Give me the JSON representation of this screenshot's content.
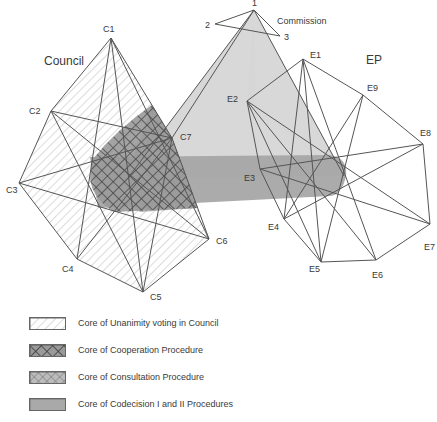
{
  "diagram": {
    "groups": {
      "council": "Council",
      "commission": "Commission",
      "ep": "EP"
    },
    "council_vertices": [
      {
        "id": "C1",
        "x": 111,
        "y": 38
      },
      {
        "id": "C2",
        "x": 51,
        "y": 111
      },
      {
        "id": "C3",
        "x": 19,
        "y": 183
      },
      {
        "id": "C4",
        "x": 77,
        "y": 259
      },
      {
        "id": "C5",
        "x": 143,
        "y": 292
      },
      {
        "id": "C6",
        "x": 209,
        "y": 239
      },
      {
        "id": "C7",
        "x": 172,
        "y": 138
      }
    ],
    "commission_vertices": [
      {
        "id": "1",
        "x": 254,
        "y": 10
      },
      {
        "id": "2",
        "x": 215,
        "y": 24
      },
      {
        "id": "3",
        "x": 280,
        "y": 36
      }
    ],
    "ep_vertices": [
      {
        "id": "E1",
        "x": 303,
        "y": 59
      },
      {
        "id": "E2",
        "x": 247,
        "y": 101
      },
      {
        "id": "E3",
        "x": 260,
        "y": 169
      },
      {
        "id": "E4",
        "x": 284,
        "y": 219
      },
      {
        "id": "E5",
        "x": 321,
        "y": 262
      },
      {
        "id": "E6",
        "x": 376,
        "y": 260
      },
      {
        "id": "E7",
        "x": 430,
        "y": 224
      },
      {
        "id": "E8",
        "x": 423,
        "y": 144
      },
      {
        "id": "E9",
        "x": 363,
        "y": 95
      }
    ]
  },
  "legend": {
    "items": [
      {
        "label": "Core of Unanimity voting in Council",
        "pattern": "diagonal-hatch"
      },
      {
        "label": "Core of Cooperation Procedure",
        "pattern": "coarse-crosshatch"
      },
      {
        "label": "Core of Consultation Procedure",
        "pattern": "fine-crosshatch"
      },
      {
        "label": "Core of Codecision  I and II Procedures",
        "pattern": "grey-fill"
      }
    ]
  },
  "colors": {
    "line": "#555555",
    "light_grey": "#d4d4d4",
    "mid_grey": "#a9a9a9",
    "dark_crosshatch": "#4a4a4a"
  }
}
